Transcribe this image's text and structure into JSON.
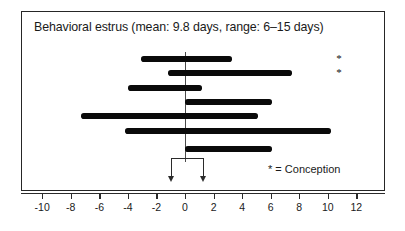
{
  "chart_data": {
    "type": "bar",
    "title": "Behavioral estrus (mean: 9.8 days, range: 6–15 days)",
    "xlabel": "",
    "ylabel": "",
    "xlim": [
      -11,
      13
    ],
    "ticks": [
      -10,
      -8,
      -6,
      -4,
      -2,
      0,
      2,
      4,
      6,
      8,
      10,
      12
    ],
    "tick_labels": [
      "-10",
      "-8",
      "-6",
      "-4",
      "-2",
      "0",
      "2",
      "4",
      "6",
      "8",
      "10",
      "12"
    ],
    "grid": false,
    "legend_position": "inside-bottom-right",
    "orientation": "horizontal-ranges",
    "bars": [
      {
        "label": "female-1",
        "start": -3.1,
        "end": 3.3,
        "row": 0
      },
      {
        "label": "female-2",
        "start": -1.2,
        "end": 7.5,
        "row": 1
      },
      {
        "label": "female-3",
        "start": -4.0,
        "end": 1.2,
        "row": 2
      },
      {
        "label": "female-4",
        "start": 0.0,
        "end": 6.1,
        "row": 3
      },
      {
        "label": "female-5",
        "start": -7.3,
        "end": 5.1,
        "row": 4
      },
      {
        "label": "female-6",
        "start": -4.2,
        "end": 10.2,
        "row": 5
      },
      {
        "label": "female-7",
        "start": 0.0,
        "end": 6.1,
        "row": 6
      }
    ],
    "annotations": {
      "conception_markers": [
        {
          "symbol": "*",
          "row": 0,
          "x_value": 10.6
        },
        {
          "symbol": "*",
          "row": 1,
          "x_value": 10.6
        }
      ],
      "bracket": {
        "from": -1,
        "to": 1,
        "label": ""
      },
      "arrows": [
        {
          "x_value": -1
        },
        {
          "x_value": 1
        }
      ]
    }
  },
  "chart": {
    "title": "Behavioral estrus (mean: 9.8 days, range: 6–15 days)",
    "legend_text": "* = Conception"
  },
  "colors": {
    "bar": "#0a0a0a",
    "frame": "#262626",
    "axis": "#2b2b2b",
    "text": "#1a1a1a",
    "background": "#ffffff"
  }
}
